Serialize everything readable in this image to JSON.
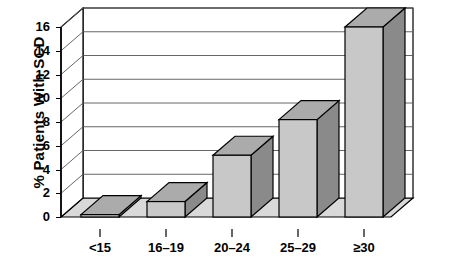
{
  "chart_data": {
    "type": "bar",
    "title": "",
    "subtitle": "",
    "xlabel": "",
    "ylabel": "% Patients With SCD",
    "categories": [
      "<15",
      "16–19",
      "20–24",
      "25–29",
      "≥30"
    ],
    "values": [
      0.2,
      1.3,
      5.2,
      8.2,
      16.0
    ],
    "ylim": [
      0,
      16
    ],
    "ytick_labels": [
      "0",
      "2",
      "4",
      "6",
      "8",
      "10",
      "12",
      "14",
      "16"
    ],
    "ytick_values": [
      0,
      2,
      4,
      6,
      8,
      10,
      12,
      14,
      16
    ],
    "grid": true,
    "grid_axis": "y",
    "legend": null,
    "legend_position": "none",
    "style": "3d-bar",
    "annotations": []
  },
  "colors": {
    "bar_front": "#c8c8c8",
    "bar_side": "#8a8a8a",
    "bar_top": "#ababab",
    "floor": "#d9d9d9",
    "back_wall": "#ffffff",
    "outline": "#000000",
    "gridline": "#555555",
    "text": "#000000",
    "background": "#ffffff"
  },
  "axis": {
    "y_title": "% Patients With SCD",
    "y_ticks": [
      {
        "label": "16",
        "value": 16
      },
      {
        "label": "14",
        "value": 14
      },
      {
        "label": "12",
        "value": 12
      },
      {
        "label": "10",
        "value": 10
      },
      {
        "label": "8",
        "value": 8
      },
      {
        "label": "6",
        "value": 6
      },
      {
        "label": "4",
        "value": 4
      },
      {
        "label": "2",
        "value": 2
      },
      {
        "label": "0",
        "value": 0
      }
    ],
    "x_ticks": [
      {
        "label": "<15"
      },
      {
        "label": "16–19"
      },
      {
        "label": "20–24"
      },
      {
        "label": "25–29"
      },
      {
        "label": "≥30"
      }
    ]
  }
}
